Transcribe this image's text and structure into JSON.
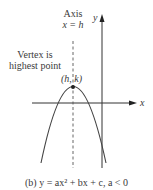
{
  "diagram": {
    "axis_label_line1": "Axis",
    "axis_label_line2": "x = h",
    "vertex_label_line1": "Vertex is",
    "vertex_label_line2": "highest point",
    "vertex_point_label": "(h, k)",
    "y_axis_label": "y",
    "x_axis_label": "x",
    "caption": "(b) y = ax² + bx + c,   a < 0"
  },
  "colors": {
    "curve": "#444444",
    "axes": "#333333",
    "dashed": "#555555"
  }
}
